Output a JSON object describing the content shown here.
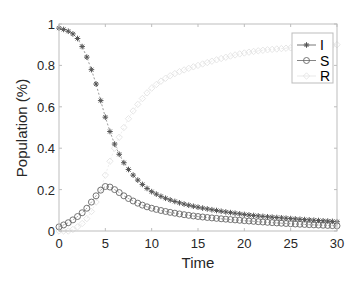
{
  "chart_data": {
    "type": "line",
    "title": "",
    "xlabel": "Time",
    "ylabel": "Population (%)",
    "xlim": [
      0,
      30
    ],
    "ylim": [
      0,
      1
    ],
    "xticks": [
      0,
      5,
      10,
      15,
      20,
      25,
      30
    ],
    "yticks": [
      0,
      0.2,
      0.4,
      0.6,
      0.8,
      1
    ],
    "ytick_labels": [
      "0",
      "0.2",
      "0.4",
      "0.6",
      "0.8",
      "1"
    ],
    "grid": false,
    "legend_position": "top-right",
    "marker_step": 0.5,
    "x": [
      0,
      1,
      2,
      3,
      4,
      5,
      6,
      7,
      8,
      9,
      10,
      12,
      15,
      20,
      25,
      30
    ],
    "series": [
      {
        "name": "I",
        "marker": "asterisk",
        "color": "#555555",
        "values": [
          0.98,
          0.965,
          0.93,
          0.84,
          0.71,
          0.55,
          0.42,
          0.33,
          0.27,
          0.225,
          0.19,
          0.15,
          0.115,
          0.08,
          0.06,
          0.045
        ]
      },
      {
        "name": "S",
        "marker": "circle",
        "color": "#666666",
        "values": [
          0.02,
          0.04,
          0.07,
          0.11,
          0.17,
          0.215,
          0.2,
          0.17,
          0.145,
          0.125,
          0.11,
          0.09,
          0.07,
          0.05,
          0.035,
          0.025
        ]
      },
      {
        "name": "R",
        "marker": "diamond",
        "color": "#e3e3e3",
        "values": [
          0.0,
          0.0,
          0.02,
          0.06,
          0.14,
          0.27,
          0.4,
          0.5,
          0.58,
          0.64,
          0.69,
          0.75,
          0.8,
          0.86,
          0.885,
          0.9
        ]
      }
    ]
  }
}
